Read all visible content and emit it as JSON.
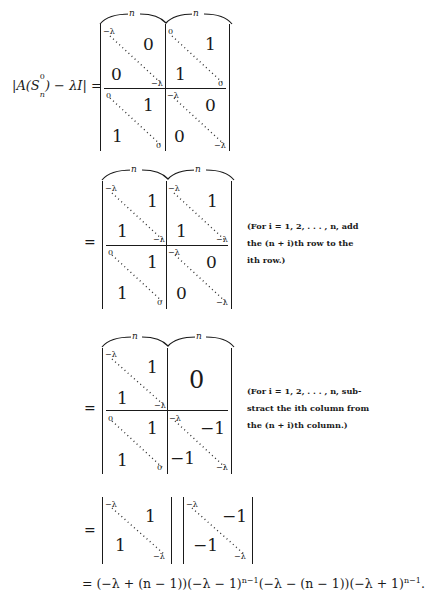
{
  "equation": {
    "lhs": "|A(S",
    "lhs_sub": "n",
    "lhs_sup": "0",
    "lhs_rest": ") − λI| =",
    "equals": "="
  },
  "brace_label": "n",
  "matrix1": {
    "tl": {
      "corner_start": "−λ",
      "offdiag": "0",
      "lower": "0",
      "corner_end": "−λ"
    },
    "tr": {
      "corner_start": "0",
      "offdiag": "1",
      "lower": "1",
      "corner_end": "0"
    },
    "bl": {
      "corner_start": "0",
      "offdiag": "1",
      "lower": "1",
      "corner_end": "0"
    },
    "br": {
      "corner_start": "−λ",
      "offdiag": "0",
      "lower": "0",
      "corner_end": "−λ"
    }
  },
  "matrix2": {
    "tl": {
      "corner_start": "−λ",
      "offdiag": "1",
      "lower": "1",
      "corner_end": "−λ"
    },
    "tr": {
      "corner_start": "−λ",
      "offdiag": "1",
      "lower": "1",
      "corner_end": "−λ"
    },
    "bl": {
      "corner_start": "0",
      "offdiag": "1",
      "lower": "1",
      "corner_end": "0"
    },
    "br": {
      "corner_start": "−λ",
      "offdiag": "0",
      "lower": "0",
      "corner_end": "−λ"
    },
    "note": [
      "(For i = 1, 2, . . . , n, add",
      "the (n + i)th row to the",
      "ith row.)"
    ]
  },
  "matrix3": {
    "tl": {
      "corner_start": "−λ",
      "offdiag": "1",
      "lower": "1",
      "corner_end": "−λ"
    },
    "tr": {
      "block": "0"
    },
    "bl": {
      "corner_start": "0",
      "offdiag": "1",
      "lower": "1",
      "corner_end": "0"
    },
    "br": {
      "corner_start": "−λ",
      "offdiag": "−1",
      "lower": "−1",
      "corner_end": "−λ"
    },
    "note": [
      "(For i = 1, 2, . . . , n, sub-",
      "stract the ith column from",
      "the (n + i)th column.)"
    ]
  },
  "product": {
    "left": {
      "corner_start": "−λ",
      "offdiag": "1",
      "lower": "1",
      "corner_end": "−λ"
    },
    "right": {
      "corner_start": "−λ",
      "offdiag": "−1",
      "lower": "−1",
      "corner_end": "−λ"
    }
  },
  "result": {
    "p1": "= (−λ + (n − 1))(−λ − 1)",
    "e1": "n−1",
    "p2": "(−λ − (n − 1))(−λ + 1)",
    "e2": "n−1",
    "p3": "."
  }
}
